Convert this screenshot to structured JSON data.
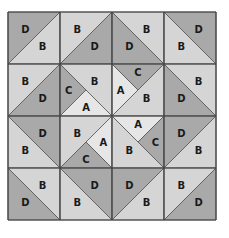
{
  "diagram": {
    "origin": [
      8,
      12
    ],
    "cell_size": 52,
    "rows": 4,
    "cols": 4,
    "colors": {
      "A": "#e6e6e6",
      "B": "#d5d5d5",
      "C": "#a9a9a9",
      "D": "#a9a9a9"
    },
    "cells": [
      [
        {
          "diag": "/",
          "pieces": [
            {
              "pos": "tl",
              "label": "D"
            },
            {
              "pos": "br",
              "label": "B"
            }
          ]
        },
        {
          "diag": "/",
          "pieces": [
            {
              "pos": "tl",
              "label": "B"
            },
            {
              "pos": "br",
              "label": "D"
            }
          ]
        },
        {
          "diag": "\\",
          "pieces": [
            {
              "pos": "tr",
              "label": "B"
            },
            {
              "pos": "bl",
              "label": "D"
            }
          ]
        },
        {
          "diag": "\\",
          "pieces": [
            {
              "pos": "tr",
              "label": "D"
            },
            {
              "pos": "bl",
              "label": "B"
            }
          ]
        }
      ],
      [
        {
          "diag": "/",
          "pieces": [
            {
              "pos": "tl",
              "label": "B"
            },
            {
              "pos": "br",
              "label": "D"
            }
          ]
        },
        {
          "diag": "\\",
          "pieces": [
            {
              "pos": "tr",
              "label": "B"
            },
            {
              "pos": "bl",
              "split": true,
              "labels": [
                "C",
                "A"
              ]
            }
          ]
        },
        {
          "diag": "/",
          "pieces": [
            {
              "pos": "tl",
              "split": true,
              "labels": [
                "A",
                "C"
              ]
            },
            {
              "pos": "br",
              "label": "B"
            }
          ]
        },
        {
          "diag": "\\",
          "pieces": [
            {
              "pos": "tr",
              "label": "B"
            },
            {
              "pos": "bl",
              "label": "D"
            }
          ]
        }
      ],
      [
        {
          "diag": "\\",
          "pieces": [
            {
              "pos": "tr",
              "label": "D"
            },
            {
              "pos": "bl",
              "label": "B"
            }
          ]
        },
        {
          "diag": "/",
          "pieces": [
            {
              "pos": "tl",
              "label": "B"
            },
            {
              "pos": "br",
              "split": true,
              "labels": [
                "A",
                "C"
              ]
            }
          ]
        },
        {
          "diag": "\\",
          "pieces": [
            {
              "pos": "tr",
              "split": true,
              "labels": [
                "A",
                "C"
              ]
            },
            {
              "pos": "bl",
              "label": "B"
            }
          ]
        },
        {
          "diag": "/",
          "pieces": [
            {
              "pos": "tl",
              "label": "D"
            },
            {
              "pos": "br",
              "label": "B"
            }
          ]
        }
      ],
      [
        {
          "diag": "\\",
          "pieces": [
            {
              "pos": "tr",
              "label": "B"
            },
            {
              "pos": "bl",
              "label": "D"
            }
          ]
        },
        {
          "diag": "\\",
          "pieces": [
            {
              "pos": "tr",
              "label": "D"
            },
            {
              "pos": "bl",
              "label": "B"
            }
          ]
        },
        {
          "diag": "/",
          "pieces": [
            {
              "pos": "tl",
              "label": "D"
            },
            {
              "pos": "br",
              "label": "B"
            }
          ]
        },
        {
          "diag": "/",
          "pieces": [
            {
              "pos": "tl",
              "label": "B"
            },
            {
              "pos": "br",
              "label": "D"
            }
          ]
        }
      ]
    ]
  }
}
